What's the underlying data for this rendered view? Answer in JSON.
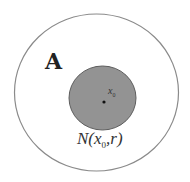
{
  "diagram": {
    "set_label": "A",
    "point_label": "x",
    "point_subscript": "0",
    "neighborhood_label": {
      "prefix": "N(",
      "var": "x",
      "subscript": "0",
      "suffix": ",r)"
    },
    "colors": {
      "outer_stroke": "#8a8a8a",
      "inner_fill": "#939393",
      "inner_stroke": "#5e5e5e",
      "point": "#111111",
      "text": "#333333"
    }
  }
}
